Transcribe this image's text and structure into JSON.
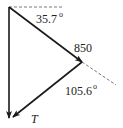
{
  "diagram": {
    "type": "force-vector-triangle",
    "colors": {
      "line": "#1a1a1a",
      "dashed": "#555555",
      "text": "#222222",
      "background": "#ffffff"
    },
    "labels": {
      "angle_top": "35.7",
      "angle_top_degree": "o",
      "force_850": "850",
      "angle_right": "105.6",
      "angle_right_degree": "o",
      "force_t": "T"
    },
    "vectors": [
      {
        "name": "850",
        "from": [
          9,
          7
        ],
        "to": [
          82,
          62
        ]
      },
      {
        "name": "T",
        "from": [
          82,
          62
        ],
        "to": [
          12,
          118
        ]
      },
      {
        "name": "resultant",
        "from": [
          9,
          7
        ],
        "to": [
          9,
          118
        ]
      }
    ],
    "reference_lines": [
      {
        "name": "horizontal",
        "from": [
          9,
          7
        ],
        "to": [
          62,
          7
        ],
        "style": "dashed"
      },
      {
        "name": "extension-850",
        "from": [
          82,
          62
        ],
        "to": [
          116,
          85
        ],
        "style": "dashed"
      }
    ],
    "angles": [
      {
        "label": "35.7°",
        "between": [
          "horizontal",
          "850"
        ]
      },
      {
        "label": "105.6°",
        "between": [
          "extension-850",
          "T"
        ]
      }
    ]
  }
}
